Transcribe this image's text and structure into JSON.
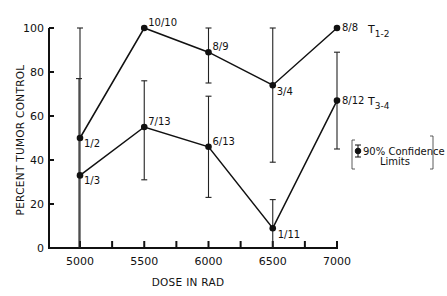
{
  "chart_data": {
    "type": "line",
    "title": "",
    "xlabel": "DOSE IN RAD",
    "ylabel": "PERCENT TUMOR CONTROL",
    "x": [
      5000,
      5500,
      6000,
      6500,
      7000
    ],
    "xticks": [
      "5000",
      "5500",
      "6000",
      "6500",
      "7000"
    ],
    "yticks": [
      "0",
      "20",
      "40",
      "60",
      "80",
      "100"
    ],
    "xlim": [
      4750,
      7000
    ],
    "ylim": [
      0,
      100
    ],
    "grid": false,
    "series": [
      {
        "name": "T1-2",
        "label_main": "T",
        "label_sub": "1-2",
        "values": [
          50,
          100,
          89,
          74,
          100
        ],
        "fractions": [
          "1/2",
          "10/10",
          "8/9",
          "3/4",
          "8/8"
        ],
        "ci_low": [
          0,
          null,
          75,
          39,
          null
        ],
        "ci_high": [
          100,
          null,
          100,
          100,
          null
        ]
      },
      {
        "name": "T3-4",
        "label_main": "T",
        "label_sub": "3-4",
        "values": [
          33,
          55,
          46,
          9,
          67
        ],
        "fractions": [
          "1/3",
          "7/13",
          "6/13",
          "1/11",
          "8/12"
        ],
        "ci_low": [
          0,
          31,
          23,
          0,
          45
        ],
        "ci_high": [
          77,
          76,
          69,
          22,
          89
        ]
      }
    ],
    "legend": {
      "position": "right",
      "line1": "90% Confidence",
      "line2": "Limits"
    },
    "annotations": [
      "1/2",
      "10/10",
      "8/9",
      "3/4",
      "8/8",
      "1/3",
      "7/13",
      "6/13",
      "1/11",
      "8/12"
    ]
  }
}
